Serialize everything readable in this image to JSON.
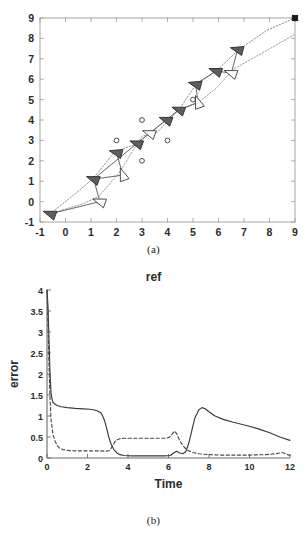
{
  "figure": {
    "panel_a": {
      "caption": "(a)"
    },
    "panel_b": {
      "caption": "(b)"
    }
  },
  "chart_data": [
    {
      "id": "panel-a",
      "type": "scatter",
      "title": "",
      "xlabel": "",
      "ylabel": "",
      "xlim": [
        -1,
        9
      ],
      "ylim": [
        -1,
        9
      ],
      "xticks": [
        -1,
        0,
        1,
        2,
        3,
        4,
        5,
        6,
        7,
        8,
        9
      ],
      "yticks": [
        -1,
        0,
        1,
        2,
        3,
        4,
        5,
        6,
        7,
        8,
        9
      ],
      "grid": false,
      "legend": "none",
      "description": "Robot formation trajectory plane with gray and white triangular robot markers, dotted reference paths, circular obstacles and a square goal marker.",
      "goal_marker": {
        "shape": "square",
        "x": 9,
        "y": 9,
        "color": "#1a1a1a"
      },
      "obstacles": [
        {
          "x": 2.0,
          "y": 3.0
        },
        {
          "x": 3.0,
          "y": 4.0
        },
        {
          "x": 3.0,
          "y": 2.0
        },
        {
          "x": 4.0,
          "y": 3.0
        },
        {
          "x": 5.0,
          "y": 5.0
        }
      ],
      "paths": [
        {
          "name": "leader-path",
          "style": "dotted",
          "color": "#8c8c8c",
          "points": [
            [
              -0.6,
              -0.6
            ],
            [
              0.4,
              0.4
            ],
            [
              1.1,
              1.15
            ],
            [
              1.9,
              2.4
            ],
            [
              2.8,
              2.85
            ],
            [
              3.9,
              3.95
            ],
            [
              4.45,
              4.5
            ],
            [
              5.1,
              5.7
            ],
            [
              5.9,
              6.4
            ],
            [
              6.8,
              7.45
            ],
            [
              7.9,
              8.4
            ],
            [
              9,
              9
            ]
          ]
        },
        {
          "name": "follower-path",
          "style": "dotted",
          "color": "#9a9a9a",
          "points": [
            [
              -0.6,
              -0.6
            ],
            [
              0.7,
              -0.1
            ],
            [
              1.3,
              0.25
            ],
            [
              2.1,
              1.4
            ],
            [
              3.0,
              3.2
            ],
            [
              3.6,
              3.4
            ],
            [
              4.4,
              4.45
            ],
            [
              5.3,
              4.95
            ],
            [
              5.9,
              5.55
            ],
            [
              6.6,
              6.5
            ],
            [
              7.6,
              7.2
            ],
            [
              9,
              8.2
            ]
          ]
        }
      ],
      "robots_filled": [
        {
          "x": -0.6,
          "y": -0.6,
          "heading": 200
        },
        {
          "x": 1.1,
          "y": 1.1,
          "heading": 200
        },
        {
          "x": 2.0,
          "y": 2.4,
          "heading": 195
        },
        {
          "x": 2.8,
          "y": 2.85,
          "heading": 200
        },
        {
          "x": 3.95,
          "y": 4.0,
          "heading": 200
        },
        {
          "x": 4.45,
          "y": 4.5,
          "heading": 200
        },
        {
          "x": 5.1,
          "y": 5.75,
          "heading": 195
        },
        {
          "x": 5.9,
          "y": 6.4,
          "heading": 200
        },
        {
          "x": 6.75,
          "y": 7.45,
          "heading": 195
        }
      ],
      "robots_open": [
        {
          "x": 1.35,
          "y": 0.0,
          "heading": 200
        },
        {
          "x": 2.25,
          "y": 1.3,
          "heading": 250
        },
        {
          "x": 3.3,
          "y": 3.35,
          "heading": 200
        },
        {
          "x": 5.2,
          "y": 4.85,
          "heading": 250
        },
        {
          "x": 6.5,
          "y": 6.3,
          "heading": 200
        }
      ]
    },
    {
      "id": "panel-b",
      "type": "line",
      "title": "ref",
      "xlabel": "Time",
      "ylabel": "error",
      "xlim": [
        0,
        12
      ],
      "ylim": [
        0,
        4
      ],
      "xticks": [
        0,
        2,
        4,
        6,
        8,
        10,
        12
      ],
      "yticks": [
        0,
        0.5,
        1,
        1.5,
        2,
        2.5,
        3,
        3.5,
        4
      ],
      "grid": false,
      "legend": "none",
      "series": [
        {
          "name": "error-solid",
          "style": "solid",
          "color": "#3a3a3a",
          "x": [
            0,
            0.05,
            0.1,
            0.15,
            0.2,
            0.25,
            0.3,
            0.4,
            0.5,
            0.7,
            1.0,
            1.4,
            1.8,
            2.1,
            2.3,
            2.5,
            2.65,
            2.75,
            2.85,
            2.95,
            3.05,
            3.15,
            3.3,
            3.45,
            3.6,
            3.8,
            4.2,
            5.0,
            5.8,
            6.1,
            6.25,
            6.4,
            6.55,
            6.7,
            6.85,
            7.0,
            7.15,
            7.3,
            7.5,
            7.65,
            7.8,
            8.0,
            8.3,
            8.7,
            9.2,
            9.8,
            10.4,
            11.0,
            11.5,
            12.0
          ],
          "y": [
            4.0,
            3.6,
            2.8,
            2.0,
            1.55,
            1.4,
            1.32,
            1.28,
            1.25,
            1.22,
            1.2,
            1.18,
            1.17,
            1.16,
            1.15,
            1.12,
            1.08,
            1.0,
            0.88,
            0.7,
            0.5,
            0.35,
            0.2,
            0.12,
            0.08,
            0.06,
            0.05,
            0.05,
            0.05,
            0.06,
            0.12,
            0.16,
            0.12,
            0.1,
            0.15,
            0.35,
            0.65,
            0.95,
            1.15,
            1.2,
            1.18,
            1.1,
            1.0,
            0.92,
            0.85,
            0.78,
            0.7,
            0.6,
            0.5,
            0.42
          ]
        },
        {
          "name": "error-dashed",
          "style": "dashed",
          "color": "#4a4a4a",
          "x": [
            0,
            0.05,
            0.1,
            0.15,
            0.2,
            0.3,
            0.4,
            0.5,
            0.6,
            0.8,
            1.0,
            1.4,
            1.8,
            2.2,
            2.6,
            2.9,
            3.1,
            3.25,
            3.4,
            3.6,
            3.8,
            4.0,
            4.4,
            5.0,
            5.5,
            5.9,
            6.05,
            6.2,
            6.3,
            6.4,
            6.55,
            6.7,
            6.85,
            7.0,
            7.2,
            7.5,
            8.0,
            8.6,
            9.2,
            10.0,
            10.8,
            11.3,
            11.6,
            11.8,
            12.0
          ],
          "y": [
            4.0,
            3.2,
            2.2,
            1.4,
            0.9,
            0.55,
            0.4,
            0.3,
            0.24,
            0.2,
            0.18,
            0.17,
            0.17,
            0.17,
            0.17,
            0.16,
            0.18,
            0.3,
            0.42,
            0.46,
            0.47,
            0.47,
            0.47,
            0.47,
            0.47,
            0.47,
            0.5,
            0.58,
            0.64,
            0.58,
            0.42,
            0.3,
            0.22,
            0.17,
            0.13,
            0.1,
            0.08,
            0.07,
            0.07,
            0.07,
            0.08,
            0.1,
            0.13,
            0.1,
            0.06
          ]
        }
      ]
    }
  ]
}
